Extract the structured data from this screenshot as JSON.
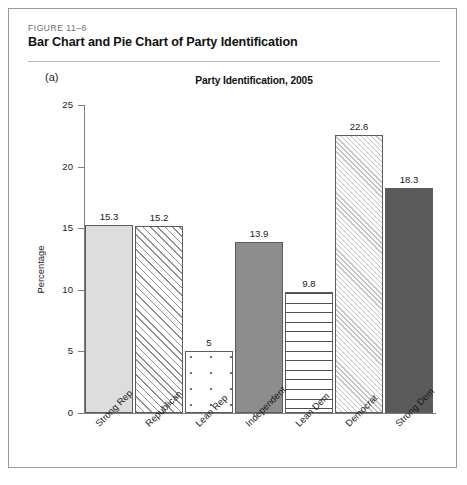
{
  "figure": {
    "number": "FIGURE 11–6",
    "title": "Bar Chart and Pie Chart of Party Identification"
  },
  "panel": {
    "label": "(a)"
  },
  "axis": {
    "ylabel": "Percentage",
    "yticks": [
      "0",
      "5",
      "10",
      "15",
      "20",
      "25"
    ]
  },
  "chart_data": {
    "type": "bar",
    "title": "Party Identification, 2005",
    "xlabel": "",
    "ylabel": "Percentage",
    "ylim": [
      0,
      25
    ],
    "ytick_values": [
      0,
      5,
      10,
      15,
      20,
      25
    ],
    "grid": false,
    "legend": "none",
    "categories": [
      "Strong Rep",
      "Republican",
      "Lean Rep",
      "Independent",
      "Lean Dem",
      "Democrat",
      "Strong Dem"
    ],
    "values": [
      15.3,
      15.2,
      5,
      13.9,
      9.8,
      22.6,
      18.3
    ],
    "data_labels": [
      "15.3",
      "15.2",
      "5",
      "13.9",
      "9.8",
      "22.6",
      "18.3"
    ],
    "bar_fills": [
      "solid-light-gray",
      "diagonal-hatch",
      "open-dots",
      "solid-medium-gray",
      "horizontal-lines",
      "fine-diagonal-hatch",
      "solid-dark-gray"
    ],
    "colors": {
      "solid_light": "#dddddd",
      "solid_medium": "#8d8d8d",
      "solid_dark": "#5a5a5a",
      "pattern_line": "#8f8f8f",
      "axis": "#7d7d7d",
      "bar_outline": "#5d5d5d"
    }
  }
}
